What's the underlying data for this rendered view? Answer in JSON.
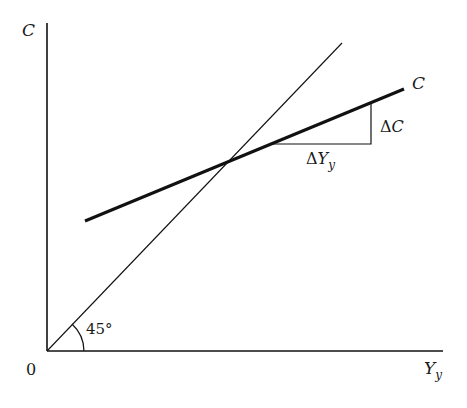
{
  "diagram": {
    "type": "consumption-function",
    "axes": {
      "y_label": "C",
      "x_label": "Y",
      "x_label_sub": "y",
      "origin_label": "0"
    },
    "lines": {
      "reference_line": {
        "name": "45-degree line",
        "angle_label": "45°"
      },
      "consumption_line": {
        "label": "C"
      }
    },
    "slope_triangle": {
      "rise_label_delta": "Δ",
      "rise_label_var": "C",
      "run_label_delta": "Δ",
      "run_label_var": "Y",
      "run_label_sub": "y"
    },
    "colors": {
      "line": "#111111",
      "background": "#ffffff"
    }
  }
}
